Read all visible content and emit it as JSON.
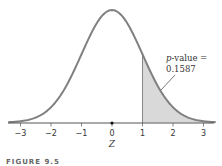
{
  "chart_data": {
    "type": "area",
    "title": "",
    "xlabel": "Z",
    "ylabel": "",
    "x_ticks": [
      -3,
      -2,
      -1,
      0,
      1,
      2,
      3
    ],
    "x_tick_labels": [
      "−3",
      "−2",
      "−1",
      "0",
      "1",
      "2",
      "3"
    ],
    "xlim": [
      -3.4,
      3.4
    ],
    "curve": "standard normal density",
    "shaded_region": {
      "from": 1,
      "to": 3.4,
      "label": "p-value = 0.1587"
    },
    "annotation": {
      "prefix": "p",
      "line1_rest": "-value =",
      "line2": "0.1587"
    },
    "marker_at": 0,
    "grid": false,
    "colors": {
      "curve": "#808080",
      "shade": "#d9d9d9",
      "axis": "#555555"
    }
  },
  "caption": "FIGURE 9.5"
}
